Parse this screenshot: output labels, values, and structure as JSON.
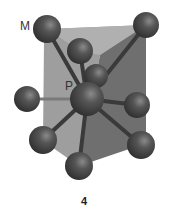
{
  "figure": {
    "caption_number": "4",
    "labels": {
      "m": "M",
      "p": "P"
    },
    "colors": {
      "face_light": "#9c9c9c",
      "face_dark": "#6e6e6e",
      "atom": "#4a4a4a",
      "bond": "#3e3e3e",
      "background": "#ffffff"
    },
    "atoms": [
      {
        "id": "m-top-left",
        "cx": 47,
        "cy": 29,
        "r": 14
      },
      {
        "id": "top-right",
        "cx": 146,
        "cy": 25,
        "r": 13
      },
      {
        "id": "front-top",
        "cx": 80,
        "cy": 51,
        "r": 13
      },
      {
        "id": "back-middle",
        "cx": 96,
        "cy": 76,
        "r": 12
      },
      {
        "id": "p-center",
        "cx": 87,
        "cy": 99,
        "r": 17
      },
      {
        "id": "left",
        "cx": 27,
        "cy": 99,
        "r": 13
      },
      {
        "id": "right",
        "cx": 137,
        "cy": 105,
        "r": 13
      },
      {
        "id": "lower-left",
        "cx": 43,
        "cy": 140,
        "r": 14
      },
      {
        "id": "lower-right",
        "cx": 141,
        "cy": 145,
        "r": 14
      },
      {
        "id": "bottom",
        "cx": 79,
        "cy": 166,
        "r": 14
      }
    ]
  }
}
